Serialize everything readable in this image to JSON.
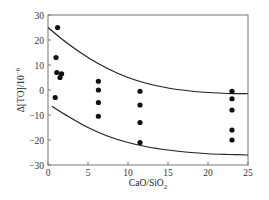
{
  "chart_data": {
    "type": "scatter",
    "title": "",
    "xlabel": "CaO/SiO2",
    "xlabel_main": "CaO/SiO",
    "xlabel_sub": "2",
    "ylabel": "Δ[TO]/10^-6",
    "ylabel_main": "Δ[TO]/10",
    "ylabel_sup": "−6",
    "xlim": [
      0,
      25
    ],
    "ylim": [
      -30,
      30
    ],
    "x_ticks": [
      0,
      5,
      10,
      15,
      20,
      25
    ],
    "y_ticks": [
      30,
      20,
      10,
      0,
      -10,
      -20,
      -30
    ],
    "x_tick_labels": [
      "0",
      "5",
      "10",
      "15",
      "20",
      "25"
    ],
    "y_tick_labels": [
      "30",
      "20",
      "10",
      "0",
      "−10",
      "−20",
      "−30"
    ],
    "grid": false,
    "legend": null,
    "series": [
      {
        "name": "measured",
        "kind": "scatter",
        "points": [
          {
            "x": 1.2,
            "y": 25
          },
          {
            "x": 1.0,
            "y": 13
          },
          {
            "x": 1.1,
            "y": 7
          },
          {
            "x": 1.7,
            "y": 6.5
          },
          {
            "x": 1.5,
            "y": 5
          },
          {
            "x": 0.9,
            "y": -3
          },
          {
            "x": 6.3,
            "y": 3.5
          },
          {
            "x": 6.3,
            "y": 0
          },
          {
            "x": 6.3,
            "y": -5
          },
          {
            "x": 6.3,
            "y": -10.5
          },
          {
            "x": 11.5,
            "y": -0.5
          },
          {
            "x": 11.5,
            "y": -6
          },
          {
            "x": 11.5,
            "y": -13
          },
          {
            "x": 11.5,
            "y": -21
          },
          {
            "x": 23.0,
            "y": -0.5
          },
          {
            "x": 23.0,
            "y": -3.5
          },
          {
            "x": 23.0,
            "y": -8
          },
          {
            "x": 23.0,
            "y": -16
          },
          {
            "x": 23.0,
            "y": -20
          }
        ]
      },
      {
        "name": "upper bound",
        "kind": "line",
        "points": [
          {
            "x": 0,
            "y": 25
          },
          {
            "x": 2.5,
            "y": 18.5
          },
          {
            "x": 5,
            "y": 13
          },
          {
            "x": 7.5,
            "y": 8.5
          },
          {
            "x": 10,
            "y": 5
          },
          {
            "x": 12.5,
            "y": 2.5
          },
          {
            "x": 15,
            "y": 0.8
          },
          {
            "x": 17.5,
            "y": -0.3
          },
          {
            "x": 20,
            "y": -1
          },
          {
            "x": 22.5,
            "y": -1.4
          },
          {
            "x": 25,
            "y": -1.5
          }
        ]
      },
      {
        "name": "lower bound",
        "kind": "line",
        "points": [
          {
            "x": 0.5,
            "y": -6.5
          },
          {
            "x": 2.5,
            "y": -10.5
          },
          {
            "x": 5,
            "y": -15
          },
          {
            "x": 7.5,
            "y": -18.5
          },
          {
            "x": 10,
            "y": -21
          },
          {
            "x": 12.5,
            "y": -22.8
          },
          {
            "x": 15,
            "y": -24
          },
          {
            "x": 17.5,
            "y": -24.9
          },
          {
            "x": 20,
            "y": -25.5
          },
          {
            "x": 22.5,
            "y": -25.8
          },
          {
            "x": 25,
            "y": -26
          }
        ]
      }
    ]
  },
  "style": {
    "axis_color": "#777777",
    "line_color": "#222222",
    "marker_color": "#111111"
  }
}
